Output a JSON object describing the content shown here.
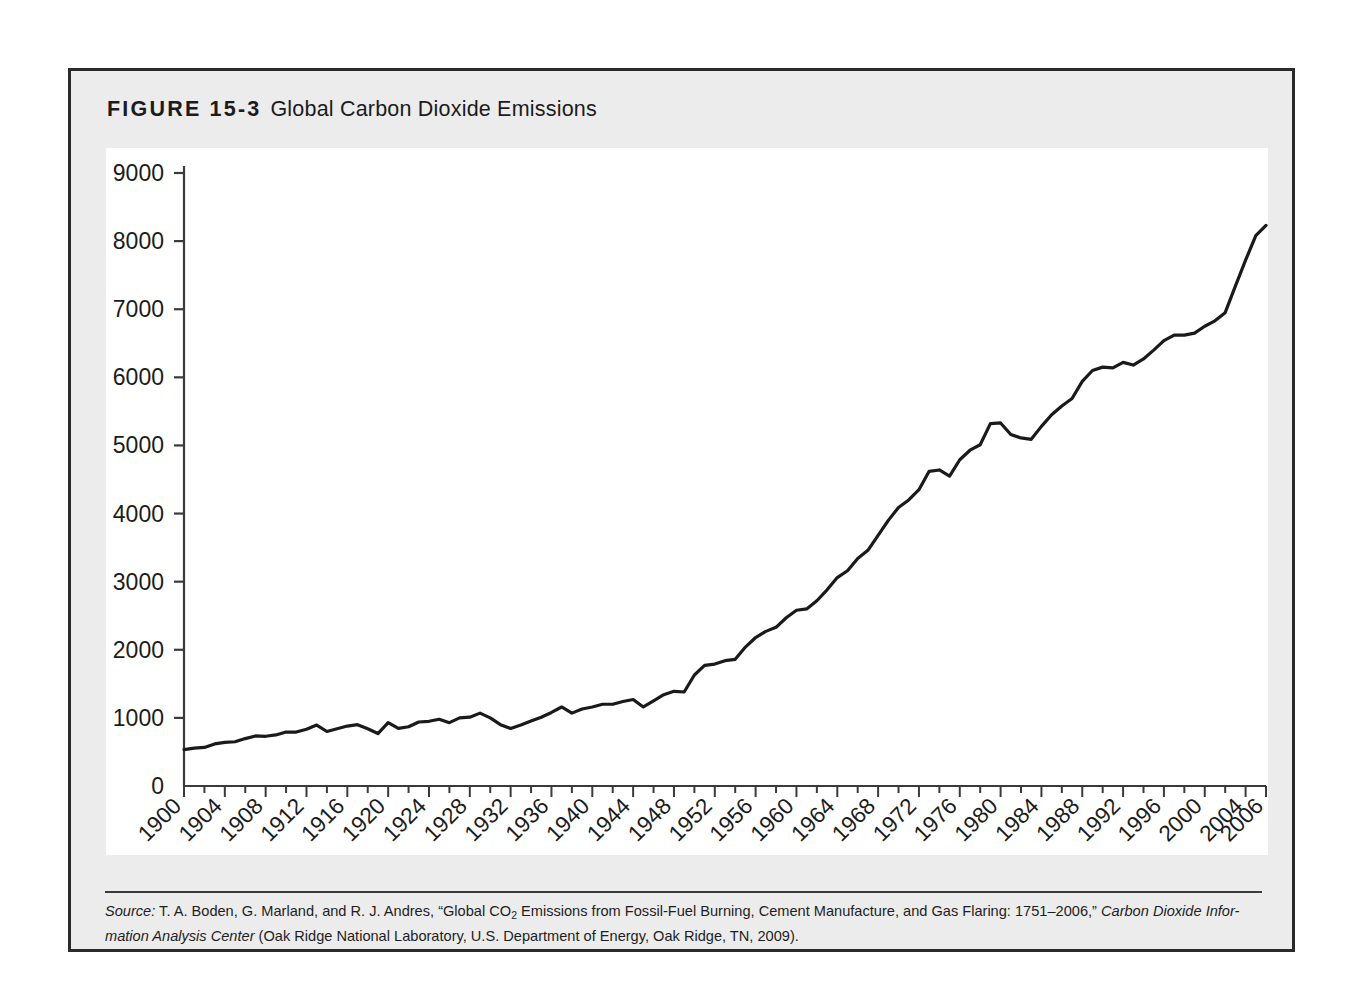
{
  "figure": {
    "number_label": "FIGURE 15-3",
    "title": "Global Carbon Dioxide Emissions"
  },
  "source": {
    "label": "Source:",
    "line1_a": " T. A. Boden, G. Marland, and R. J. Andres, “Global CO",
    "line1_sub": "2",
    "line1_b": " Emissions from Fossil-Fuel Burning, Cement Manufacture, and Gas Flaring: 1751–2006,” ",
    "line1_ital": "Carbon Dioxide Infor-",
    "line2_ital": "mation Analysis Center",
    "line2_b": " (Oak Ridge National Laboratory, U.S. Department of Energy, Oak Ridge, TN, 2009)."
  },
  "chart_data": {
    "type": "line",
    "title": "Global Carbon Dioxide Emissions",
    "xlabel": "",
    "ylabel": "",
    "xlim": [
      1900,
      2006
    ],
    "ylim": [
      0,
      9000
    ],
    "ytick_step": 1000,
    "yticks": [
      0,
      1000,
      2000,
      3000,
      4000,
      5000,
      6000,
      7000,
      8000,
      9000
    ],
    "ytick_labels": [
      "0",
      "1000",
      "2000",
      "3000",
      "4000",
      "5000",
      "6000",
      "7000",
      "8000",
      "9000"
    ],
    "xticks": [
      1900,
      1904,
      1908,
      1912,
      1916,
      1920,
      1924,
      1928,
      1932,
      1936,
      1940,
      1944,
      1948,
      1952,
      1956,
      1960,
      1964,
      1968,
      1972,
      1976,
      1980,
      1984,
      1988,
      1992,
      1996,
      2000,
      2004,
      2006
    ],
    "xtick_labels": [
      "1900",
      "1904",
      "1908",
      "1912",
      "1916",
      "1920",
      "1924",
      "1928",
      "1932",
      "1936",
      "1940",
      "1944",
      "1948",
      "1952",
      "1956",
      "1960",
      "1964",
      "1968",
      "1972",
      "1976",
      "1980",
      "1984",
      "1988",
      "1992",
      "1996",
      "2000",
      "2004",
      "2006"
    ],
    "xtick_minor_every": 2,
    "xtick_rotation_deg": -45,
    "grid": false,
    "legend": null,
    "line_color": "#1a1a1a",
    "line_width": 3.2,
    "x": [
      1900,
      1901,
      1902,
      1903,
      1904,
      1905,
      1906,
      1907,
      1908,
      1909,
      1910,
      1911,
      1912,
      1913,
      1914,
      1915,
      1916,
      1917,
      1918,
      1919,
      1920,
      1921,
      1922,
      1923,
      1924,
      1925,
      1926,
      1927,
      1928,
      1929,
      1930,
      1931,
      1932,
      1933,
      1934,
      1935,
      1936,
      1937,
      1938,
      1939,
      1940,
      1941,
      1942,
      1943,
      1944,
      1945,
      1946,
      1947,
      1948,
      1949,
      1950,
      1951,
      1952,
      1953,
      1954,
      1955,
      1956,
      1957,
      1958,
      1959,
      1960,
      1961,
      1962,
      1963,
      1964,
      1965,
      1966,
      1967,
      1968,
      1969,
      1970,
      1971,
      1972,
      1973,
      1974,
      1975,
      1976,
      1977,
      1978,
      1979,
      1980,
      1981,
      1982,
      1983,
      1984,
      1985,
      1986,
      1987,
      1988,
      1989,
      1990,
      1991,
      1992,
      1993,
      1994,
      1995,
      1996,
      1997,
      1998,
      1999,
      2000,
      2001,
      2002,
      2003,
      2004,
      2005,
      2006
    ],
    "y": [
      534,
      556,
      566,
      618,
      640,
      650,
      696,
      735,
      730,
      750,
      792,
      792,
      834,
      895,
      800,
      840,
      880,
      900,
      840,
      770,
      930,
      845,
      870,
      940,
      950,
      980,
      930,
      1000,
      1010,
      1070,
      1000,
      900,
      845,
      895,
      955,
      1010,
      1080,
      1160,
      1070,
      1130,
      1160,
      1200,
      1200,
      1240,
      1270,
      1160,
      1250,
      1340,
      1390,
      1380,
      1630,
      1770,
      1790,
      1840,
      1860,
      2040,
      2180,
      2270,
      2330,
      2470,
      2580,
      2600,
      2720,
      2880,
      3060,
      3160,
      3340,
      3460,
      3680,
      3900,
      4090,
      4200,
      4350,
      4620,
      4640,
      4550,
      4790,
      4930,
      5010,
      5320,
      5330,
      5160,
      5110,
      5090,
      5280,
      5450,
      5580,
      5690,
      5940,
      6100,
      6150,
      6140,
      6220,
      6180,
      6270,
      6400,
      6540,
      6620,
      6620,
      6650,
      6750,
      6830,
      6950,
      7340,
      7720,
      8080,
      8230
    ],
    "x_axis_color": "#3a3a3a",
    "y_axis_color": "#3a3a3a"
  }
}
